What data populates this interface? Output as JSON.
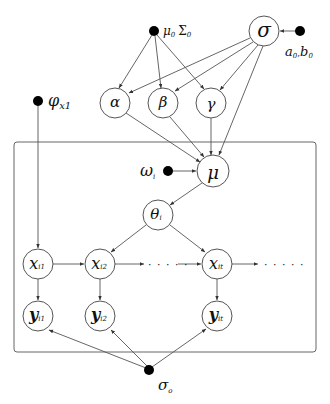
{
  "diagram": {
    "type": "probabilistic graphical model",
    "plate": {
      "label": ""
    },
    "hyperparameters": [
      {
        "id": "mu0_sigma0",
        "main": "μ₀ Σ₀",
        "label": "μ",
        "sub": "0",
        "label2": "Σ",
        "sub2": "0"
      },
      {
        "id": "a0_b0",
        "label": "a",
        "sub": "0",
        "sep": ",",
        "label2": "b",
        "sub2": "0"
      },
      {
        "id": "phi_x1",
        "label": "φ",
        "sub": "x1"
      },
      {
        "id": "omega_i",
        "label": "ω",
        "sub": "i"
      },
      {
        "id": "sigma_o",
        "label": "σ",
        "sub": "o"
      }
    ],
    "nodes": {
      "sigma": {
        "label": "σ"
      },
      "alpha": {
        "label": "α"
      },
      "beta": {
        "label": "β"
      },
      "gamma": {
        "label": "γ"
      },
      "mu": {
        "label": "μ"
      },
      "theta": {
        "label": "θ",
        "sub": "i"
      },
      "x1": {
        "label": "x",
        "sub": "i1"
      },
      "x2": {
        "label": "x",
        "sub": "i2"
      },
      "xt": {
        "label": "x",
        "sub": "it"
      },
      "y1": {
        "label": "y",
        "sub": "i1"
      },
      "y2": {
        "label": "y",
        "sub": "i2"
      },
      "yt": {
        "label": "y",
        "sub": "it"
      }
    },
    "ellipsis": "· · · · ·",
    "edges": [
      [
        "a0_b0",
        "sigma"
      ],
      [
        "mu0_sigma0",
        "alpha"
      ],
      [
        "mu0_sigma0",
        "beta"
      ],
      [
        "mu0_sigma0",
        "gamma"
      ],
      [
        "sigma",
        "alpha"
      ],
      [
        "sigma",
        "beta"
      ],
      [
        "sigma",
        "gamma"
      ],
      [
        "sigma",
        "mu"
      ],
      [
        "alpha",
        "mu"
      ],
      [
        "beta",
        "mu"
      ],
      [
        "gamma",
        "mu"
      ],
      [
        "omega_i",
        "mu"
      ],
      [
        "mu",
        "theta"
      ],
      [
        "theta",
        "x2"
      ],
      [
        "theta",
        "xt"
      ],
      [
        "phi_x1",
        "x1"
      ],
      [
        "x1",
        "x2"
      ],
      [
        "x2",
        "..."
      ],
      [
        "...",
        "xt"
      ],
      [
        "xt",
        "..."
      ],
      [
        "x1",
        "y1"
      ],
      [
        "x2",
        "y2"
      ],
      [
        "xt",
        "yt"
      ],
      [
        "sigma_o",
        "y1"
      ],
      [
        "sigma_o",
        "y2"
      ],
      [
        "sigma_o",
        "yt"
      ]
    ]
  }
}
